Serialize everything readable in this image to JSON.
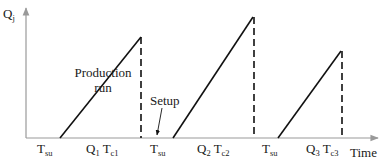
{
  "diagram": {
    "y_axis": {
      "label": "Q",
      "subscript": "j"
    },
    "x_axis": {
      "label": "Time"
    },
    "annotations": {
      "production_run_line1": "Production",
      "production_run_line2": "run",
      "setup": "Setup"
    },
    "cycles": [
      {
        "setup_label": "T",
        "setup_sub": "su",
        "q_label": "Q",
        "q_sub": "1",
        "t_label": "T",
        "t_sub": "c1"
      },
      {
        "setup_label": "T",
        "setup_sub": "su",
        "q_label": "Q",
        "q_sub": "2",
        "t_label": "T",
        "t_sub": "c2"
      },
      {
        "setup_label": "T",
        "setup_sub": "su",
        "q_label": "Q",
        "q_sub": "3",
        "t_label": "T",
        "t_sub": "c3"
      }
    ],
    "colors": {
      "axis": "#999999",
      "line": "#111111",
      "text": "#1a1a1a"
    }
  }
}
